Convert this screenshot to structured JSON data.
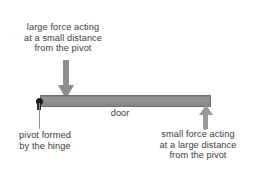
{
  "diagram": {
    "background_color": "#ffffff",
    "text_color": "#3b3b3b",
    "beam_color": "#8d8d8d",
    "arrow_color": "#8f8f8f",
    "pivot_color": "#1a1a1a"
  },
  "beam": {
    "label": "door"
  },
  "force_large": {
    "line1": "large force acting",
    "line2": "at a small distance",
    "line3": "from the pivot",
    "arrow_direction": "down"
  },
  "pivot": {
    "line1": "pivot formed",
    "line2": "by the hinge"
  },
  "force_small": {
    "line1": "small force acting",
    "line2": "at a large distance",
    "line3": "from the pivot",
    "arrow_direction": "up"
  }
}
